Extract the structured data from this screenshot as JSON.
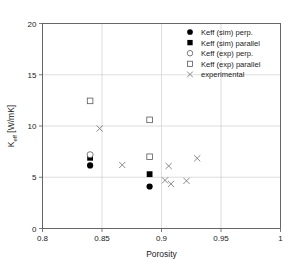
{
  "chart_data": {
    "type": "scatter",
    "title": "",
    "xlabel": "Porosity",
    "ylabel": "K_eff [W/mK]",
    "ylabel_base": "K",
    "ylabel_sub": "eff",
    "ylabel_unit": " [W/mK]",
    "xlim": [
      0.8,
      1.0
    ],
    "ylim": [
      0,
      20
    ],
    "xticks": [
      "0.8",
      "0.85",
      "0.9",
      "0.95",
      "1"
    ],
    "xtick_values": [
      0.8,
      0.85,
      0.9,
      0.95,
      1.0
    ],
    "yticks": [
      "0",
      "5",
      "10",
      "15",
      "20"
    ],
    "ytick_values": [
      0,
      5,
      10,
      15,
      20
    ],
    "grid": true,
    "legend_position": "top-right",
    "series": [
      {
        "name": "Keff (sim) perp.",
        "marker": "filled-circle",
        "color": "#000000",
        "points": [
          {
            "x": 0.84,
            "y": 6.15
          },
          {
            "x": 0.89,
            "y": 4.1
          }
        ]
      },
      {
        "name": "Keff (sim) parallel",
        "marker": "filled-square",
        "color": "#000000",
        "points": [
          {
            "x": 0.84,
            "y": 6.9
          },
          {
            "x": 0.89,
            "y": 5.3
          }
        ]
      },
      {
        "name": "Keff (exp) perp.",
        "marker": "open-circle",
        "color": "#5a5a5a",
        "points": [
          {
            "x": 0.84,
            "y": 7.2
          }
        ]
      },
      {
        "name": "Keff (exp) parallel",
        "marker": "open-square",
        "color": "#5a5a5a",
        "points": [
          {
            "x": 0.84,
            "y": 12.45
          },
          {
            "x": 0.89,
            "y": 10.6
          },
          {
            "x": 0.89,
            "y": 7.0
          }
        ]
      },
      {
        "name": "experimental",
        "marker": "cross",
        "color": "#7d7d7d",
        "points": [
          {
            "x": 0.848,
            "y": 9.75
          },
          {
            "x": 0.867,
            "y": 6.2
          },
          {
            "x": 0.906,
            "y": 6.1
          },
          {
            "x": 0.93,
            "y": 6.85
          },
          {
            "x": 0.903,
            "y": 4.7
          },
          {
            "x": 0.908,
            "y": 4.35
          },
          {
            "x": 0.921,
            "y": 4.65
          }
        ]
      }
    ],
    "legend_entries": [
      {
        "label": "Keff (sim) perp.",
        "marker": "filled-circle"
      },
      {
        "label": "Keff (sim) parallel",
        "marker": "filled-square"
      },
      {
        "label": "Keff (exp) perp.",
        "marker": "open-circle"
      },
      {
        "label": "Keff (exp) parallel",
        "marker": "open-square"
      },
      {
        "label": "experimental",
        "marker": "cross"
      }
    ]
  }
}
